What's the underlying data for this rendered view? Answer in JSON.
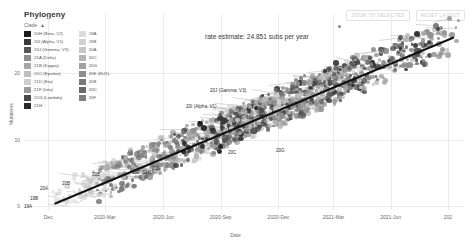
{
  "panel": {
    "title": "Phylogeny",
    "controls": [
      {
        "id": "zoom-to-selected",
        "label": "ZOOM TO SELECTED"
      },
      {
        "id": "reset-layout",
        "label": "RESET LAYOUT"
      }
    ]
  },
  "legend": {
    "title": "Clade",
    "sort_indicator": "▲",
    "columns": [
      [
        {
          "label": "20H (Beta, V2)",
          "color": "#1b1b1b"
        },
        {
          "label": "20I (Alpha, V1)",
          "color": "#3a3a3a"
        },
        {
          "label": "20J (Gamma, V3)",
          "color": "#585858"
        },
        {
          "label": "21A (Delta)",
          "color": "#8f8f8f"
        },
        {
          "label": "21B (Kappa)",
          "color": "#a8a8a8"
        },
        {
          "label": "21C (Epsilon)",
          "color": "#c0c0c0"
        },
        {
          "label": "21D (Eta)",
          "color": "#cfcfcf"
        },
        {
          "label": "21F (Iota)",
          "color": "#9b9b9b"
        },
        {
          "label": "21G (Lambda)",
          "color": "#4a4a4a"
        },
        {
          "label": "21H",
          "color": "#2a2a2a"
        }
      ],
      [
        {
          "label": "19A",
          "color": "#dcdcdc"
        },
        {
          "label": "19B",
          "color": "#d2d2d2"
        },
        {
          "label": "20A",
          "color": "#c6c6c6"
        },
        {
          "label": "20C",
          "color": "#b4b4b4"
        },
        {
          "label": "20G",
          "color": "#a2a2a2"
        },
        {
          "label": "20E (EU1)",
          "color": "#8d8d8d"
        },
        {
          "label": "20B",
          "color": "#7a7a7a"
        },
        {
          "label": "20D",
          "color": "#6a6a6a"
        },
        {
          "label": "20F",
          "color": "#7f7f7f"
        }
      ]
    ]
  },
  "annotations": {
    "rate_estimate": "rate estimate: 24.851 subs per year",
    "clade_labels": [
      {
        "text": "20J (Gamma, V3)",
        "x": 210,
        "y": 88
      },
      {
        "text": "20I (Alpha, V1)",
        "x": 186,
        "y": 104
      },
      {
        "text": "21A (Delta)",
        "x": 246,
        "y": 115
      },
      {
        "text": "21J",
        "x": 258,
        "y": 122
      },
      {
        "text": "20E (EU1)",
        "x": 132,
        "y": 170
      },
      {
        "text": "20B",
        "x": 92,
        "y": 172
      },
      {
        "text": "20D",
        "x": 152,
        "y": 166
      },
      {
        "text": "20C",
        "x": 228,
        "y": 150
      },
      {
        "text": "20G",
        "x": 276,
        "y": 148
      },
      {
        "text": "20A",
        "x": 40,
        "y": 186
      },
      {
        "text": "20B",
        "x": 62,
        "y": 181
      },
      {
        "text": "19B",
        "x": 30,
        "y": 196
      },
      {
        "text": "19A",
        "x": 24,
        "y": 204
      }
    ]
  },
  "chart_data": {
    "type": "scatter",
    "title": "Phylogeny",
    "xlabel": "Date",
    "ylabel": "Mutations",
    "grid": true,
    "legend_position": "top-left",
    "x_ticks": [
      "Dec",
      "2020-Mar",
      "2020-Jun",
      "2020-Sep",
      "2020-Dec",
      "2021-Mar",
      "2021-Jun",
      "202"
    ],
    "x_tick_positions": [
      33,
      110,
      190,
      268,
      347,
      422,
      500,
      578
    ],
    "y_ticks": [
      "20",
      "10",
      "0"
    ],
    "y_tick_values": [
      20,
      10,
      0
    ],
    "ylim": [
      0,
      28
    ],
    "regression": {
      "label": "rate estimate: 24.851 subs per year",
      "slope_subs_per_year": 24.851,
      "x_start": "2019-Dec",
      "x_end": "2021-Aug",
      "y_start": 0,
      "y_end": 25.5
    },
    "series": [
      {
        "name": "19A",
        "color": "#dcdcdc",
        "n_tips": 30
      },
      {
        "name": "19B",
        "color": "#d2d2d2",
        "n_tips": 28
      },
      {
        "name": "20A",
        "color": "#c6c6c6",
        "n_tips": 140
      },
      {
        "name": "20B",
        "color": "#7a7a7a",
        "n_tips": 150
      },
      {
        "name": "20C",
        "color": "#b4b4b4",
        "n_tips": 110
      },
      {
        "name": "20D",
        "color": "#6a6a6a",
        "n_tips": 70
      },
      {
        "name": "20E (EU1)",
        "color": "#8d8d8d",
        "n_tips": 120
      },
      {
        "name": "20F",
        "color": "#7f7f7f",
        "n_tips": 40
      },
      {
        "name": "20G",
        "color": "#a2a2a2",
        "n_tips": 90
      },
      {
        "name": "20H (Beta, V2)",
        "color": "#1b1b1b",
        "n_tips": 60
      },
      {
        "name": "20I (Alpha, V1)",
        "color": "#3a3a3a",
        "n_tips": 180
      },
      {
        "name": "20J (Gamma, V3)",
        "color": "#585858",
        "n_tips": 90
      },
      {
        "name": "21A (Delta)",
        "color": "#8f8f8f",
        "n_tips": 200
      },
      {
        "name": "21B (Kappa)",
        "color": "#a8a8a8",
        "n_tips": 35
      },
      {
        "name": "21C (Epsilon)",
        "color": "#c0c0c0",
        "n_tips": 45
      },
      {
        "name": "21D (Eta)",
        "color": "#cfcfcf",
        "n_tips": 25
      },
      {
        "name": "21F (Iota)",
        "color": "#9b9b9b",
        "n_tips": 40
      },
      {
        "name": "21G (Lambda)",
        "color": "#4a4a4a",
        "n_tips": 30
      },
      {
        "name": "21H",
        "color": "#2a2a2a",
        "n_tips": 20
      }
    ]
  }
}
